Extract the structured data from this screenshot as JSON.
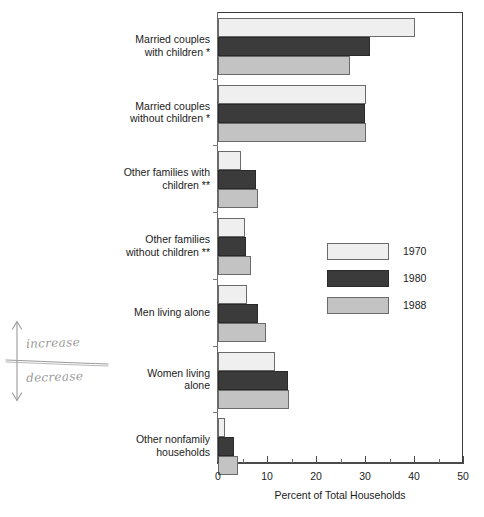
{
  "chart_data": {
    "type": "bar",
    "orientation": "horizontal",
    "title": "",
    "xlabel": "Percent of Total Households",
    "ylabel": "",
    "xlim": [
      0,
      50
    ],
    "xticks": [
      0,
      10,
      20,
      30,
      40,
      50
    ],
    "xtick_labels": [
      "0",
      "10",
      "20",
      "30",
      "40",
      "50"
    ],
    "minor_ticks": [
      5,
      15,
      25,
      35,
      45
    ],
    "grid": false,
    "legend_position": "center-right",
    "categories": [
      "Married couples with children *",
      "Married couples without children *",
      "Other families with children **",
      "Other families without children **",
      "Men living alone",
      "Women living alone",
      "Other nonfamily households"
    ],
    "category_lines": [
      [
        "Married couples",
        "with children *"
      ],
      [
        "Married couples",
        "without children *"
      ],
      [
        "Other families with",
        "children **"
      ],
      [
        "Other families",
        "without children **"
      ],
      [
        "Men living alone"
      ],
      [
        "Women living",
        "alone"
      ],
      [
        "Other nonfamily",
        "households"
      ]
    ],
    "series": [
      {
        "name": "1970",
        "color": "#efefef",
        "values": [
          40.3,
          30.3,
          4.7,
          5.5,
          5.9,
          11.7,
          1.5
        ]
      },
      {
        "name": "1980",
        "color": "#3b3b3b",
        "values": [
          31.0,
          30.1,
          7.7,
          5.7,
          8.2,
          14.3,
          3.2
        ]
      },
      {
        "name": "1988",
        "color": "#c3c3c3",
        "values": [
          26.9,
          30.3,
          8.2,
          6.7,
          9.8,
          14.4,
          4.1
        ]
      }
    ]
  },
  "legend": {
    "entries": [
      {
        "label": "1970"
      },
      {
        "label": "1980"
      },
      {
        "label": "1988"
      }
    ]
  },
  "annotation": {
    "increase_label": "increase",
    "decrease_label": "decrease",
    "up_arrow_icon": "arrow-up-icon",
    "down_arrow_icon": "arrow-down-icon"
  },
  "colors": {
    "series_1970": "#efefef",
    "series_1980": "#3b3b3b",
    "series_1988": "#c3c3c3",
    "axis": "#4a4a4a",
    "annotation_ink": "#9a9a9a"
  }
}
